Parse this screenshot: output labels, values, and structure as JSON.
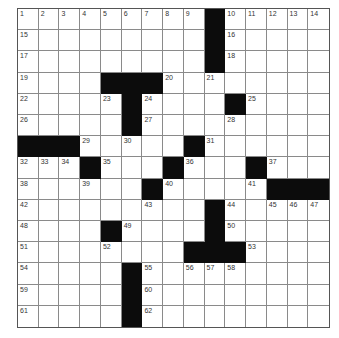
{
  "puzzle": {
    "rows": 15,
    "cols": 15,
    "colors": {
      "black": "#0c0c0c",
      "white": "#ffffff",
      "grid_line": "#8a8a8a"
    },
    "layout": [
      "........ .#.....",
      "",
      "",
      ""
    ],
    "grid": [
      [
        1,
        2,
        3,
        4,
        5,
        6,
        7,
        8,
        9,
        "#",
        10,
        11,
        12,
        13,
        14
      ],
      [
        15,
        0,
        0,
        0,
        0,
        0,
        0,
        0,
        0,
        "#",
        16,
        0,
        0,
        0,
        0
      ],
      [
        17,
        0,
        0,
        0,
        0,
        0,
        0,
        0,
        0,
        "#",
        18,
        0,
        0,
        0,
        0
      ],
      [
        19,
        0,
        0,
        0,
        "#",
        "#",
        "#",
        20,
        0,
        21,
        0,
        0,
        0,
        0,
        0
      ],
      [
        22,
        0,
        0,
        0,
        23,
        "#",
        24,
        0,
        0,
        0,
        "#",
        25,
        0,
        0,
        0
      ],
      [
        26,
        0,
        0,
        0,
        0,
        "#",
        27,
        0,
        0,
        0,
        28,
        0,
        0,
        0,
        0
      ],
      [
        "#",
        "#",
        "#",
        29,
        0,
        30,
        0,
        0,
        "#",
        31,
        0,
        0,
        0,
        0,
        0
      ],
      [
        32,
        33,
        34,
        "#",
        35,
        0,
        0,
        "#",
        36,
        0,
        0,
        "#",
        37,
        0,
        0
      ],
      [
        38,
        0,
        0,
        39,
        0,
        0,
        "#",
        40,
        0,
        0,
        0,
        41,
        "#",
        "#",
        "#"
      ],
      [
        42,
        0,
        0,
        0,
        0,
        0,
        43,
        0,
        0,
        "#",
        44,
        0,
        45,
        46,
        47
      ],
      [
        48,
        0,
        0,
        0,
        "#",
        49,
        0,
        0,
        0,
        "#",
        50,
        0,
        0,
        0,
        0
      ],
      [
        51,
        0,
        0,
        0,
        52,
        0,
        0,
        0,
        "#",
        "#",
        "#",
        53,
        0,
        0,
        0
      ],
      [
        54,
        0,
        0,
        0,
        0,
        "#",
        55,
        0,
        56,
        57,
        58,
        0,
        0,
        0,
        0
      ],
      [
        59,
        0,
        0,
        0,
        0,
        "#",
        60,
        0,
        0,
        0,
        0,
        0,
        0,
        0,
        0
      ],
      [
        61,
        0,
        0,
        0,
        0,
        "#",
        62,
        0,
        0,
        0,
        0,
        0,
        0,
        0,
        0
      ]
    ]
  }
}
